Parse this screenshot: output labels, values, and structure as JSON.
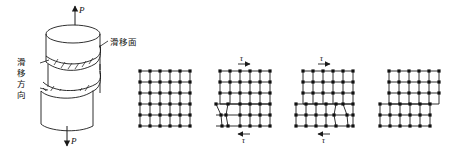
{
  "figure": {
    "background_color": "#ffffff",
    "line_color": "#1a1a1a",
    "node_color": "#111111"
  },
  "specimen": {
    "name": "cylindrical-specimen",
    "load_top_label": "P",
    "load_bottom_label": "P",
    "slip_plane_label": "滑移面",
    "slip_direction_label": "滑移方向",
    "slip_direction_chars": [
      "滑",
      "移",
      "方",
      "向"
    ],
    "slip_band_count": 2,
    "hatch_marks_per_band": 6
  },
  "lattices": [
    {
      "name": "lattice-stage-1",
      "caption": "",
      "shear_top_label": "",
      "shear_bottom_label": "",
      "state": "perfect-lattice",
      "columns": 6,
      "rows": 6
    },
    {
      "name": "lattice-stage-2",
      "caption": "",
      "shear_top_label": "τ",
      "shear_bottom_label": "τ",
      "state": "dislocation-left",
      "columns": 6,
      "rows": 6
    },
    {
      "name": "lattice-stage-3",
      "caption": "",
      "shear_top_label": "τ",
      "shear_bottom_label": "τ",
      "state": "dislocation-right",
      "columns": 6,
      "rows": 6
    },
    {
      "name": "lattice-stage-4",
      "caption": "",
      "shear_top_label": "",
      "shear_bottom_label": "",
      "state": "slip-step-formed",
      "columns": 6,
      "rows": 6
    }
  ],
  "symbols": {
    "tau": "τ",
    "load": "P",
    "arrow_right": "→",
    "arrow_left": "←"
  }
}
